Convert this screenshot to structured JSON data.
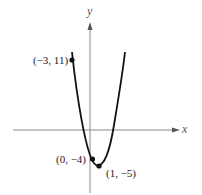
{
  "figure": {
    "x_axis_label": "x",
    "y_axis_label": "y",
    "points": [
      {
        "label": "(−3, 11)",
        "x": -3,
        "y": 11
      },
      {
        "label": "(0, −4)",
        "x": 0,
        "y": -4
      },
      {
        "label": "(1, −5)",
        "x": 1,
        "y": -5
      }
    ],
    "curve": "parabola opening upward, vertex at (1, −5)",
    "colors": {
      "curve": "#111111",
      "axes": "#888888",
      "background": "#ffffff"
    }
  }
}
